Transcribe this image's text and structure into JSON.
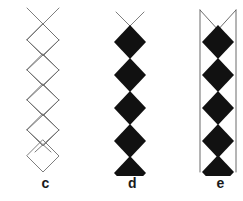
{
  "figure": {
    "type": "line-diagram",
    "background_color": "#ffffff",
    "panel_count": 3
  },
  "style": {
    "outline_color": "#6f6f6f",
    "fill_color": "#111111",
    "rail_color": "#5a5a5a",
    "label_color": "#1a1a1a",
    "stroke_width": 0.9
  },
  "panels": [
    {
      "id": "c",
      "label": "c",
      "diamond_count": 5,
      "fill": "none",
      "outline": true,
      "has_top_crossing": true,
      "has_side_rails": false,
      "geometry": {
        "center_x": 38,
        "half_width": 16,
        "half_height": 16,
        "first_center_y": 40,
        "pitch": 30,
        "top_crossing_y": 10,
        "overshoot": 8
      }
    },
    {
      "id": "d",
      "label": "d",
      "diamond_count": 5,
      "fill": "solid",
      "outline": false,
      "has_top_crossing": true,
      "has_side_rails": false,
      "geometry": {
        "center_x": 38,
        "half_width": 16,
        "half_height": 17,
        "first_center_y": 42,
        "pitch": 33,
        "top_crossing_y": 12,
        "overshoot": 0
      }
    },
    {
      "id": "e",
      "label": "e",
      "diamond_count": 5,
      "fill": "solid",
      "outline": false,
      "has_top_crossing": true,
      "has_side_rails": true,
      "geometry": {
        "center_x": 38,
        "half_width": 16,
        "half_height": 17,
        "first_center_y": 42,
        "pitch": 33,
        "top_crossing_y": 10,
        "rail_offset": 18,
        "rail_top_y": 10,
        "rail_bottom_y": 172
      }
    }
  ],
  "labels": {
    "c": "c",
    "d": "d",
    "e": "e"
  }
}
